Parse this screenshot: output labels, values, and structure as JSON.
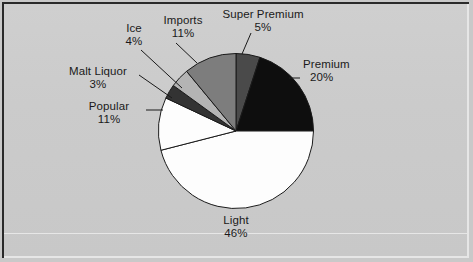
{
  "figure": {
    "background_color": "#cbcbcb",
    "frame_color": "#2a2a2a",
    "bevel_color": "#e6e6e6"
  },
  "chart_data": {
    "type": "pie",
    "title": "",
    "subtitle": "",
    "xlabel": "",
    "ylabel": "",
    "legend_position": "none",
    "grid": false,
    "units": "percent",
    "start_angle_deg": 0,
    "direction": "clockwise",
    "categories": [
      "Super Premium",
      "Premium",
      "Light",
      "Popular",
      "Malt Liquor",
      "Ice",
      "Imports"
    ],
    "values": [
      5,
      20,
      46,
      11,
      3,
      4,
      11
    ],
    "labels": [
      "5%",
      "20%",
      "46%",
      "11%",
      "3%",
      "4%",
      "11%"
    ],
    "colors": [
      "#4a4a4a",
      "#0e0e0e",
      "#fdfdfd",
      "#fdfdfd",
      "#333333",
      "#b4b4b4",
      "#7d7d7d"
    ],
    "slices": [
      {
        "name": "Super Premium",
        "value": 5,
        "label": "5%",
        "color": "#4a4a4a",
        "start_deg": 0,
        "end_deg": 18
      },
      {
        "name": "Premium",
        "value": 20,
        "label": "20%",
        "color": "#0e0e0e",
        "start_deg": 18,
        "end_deg": 90
      },
      {
        "name": "Light",
        "value": 46,
        "label": "46%",
        "color": "#fdfdfd",
        "start_deg": 90,
        "end_deg": 255.6
      },
      {
        "name": "Popular",
        "value": 11,
        "label": "11%",
        "color": "#fdfdfd",
        "start_deg": 255.6,
        "end_deg": 295.2
      },
      {
        "name": "Malt Liquor",
        "value": 3,
        "label": "3%",
        "color": "#333333",
        "start_deg": 295.2,
        "end_deg": 306
      },
      {
        "name": "Ice",
        "value": 4,
        "label": "4%",
        "color": "#b4b4b4",
        "start_deg": 306,
        "end_deg": 320.4
      },
      {
        "name": "Imports",
        "value": 11,
        "label": "11%",
        "color": "#7d7d7d",
        "start_deg": 320.4,
        "end_deg": 360
      }
    ]
  }
}
